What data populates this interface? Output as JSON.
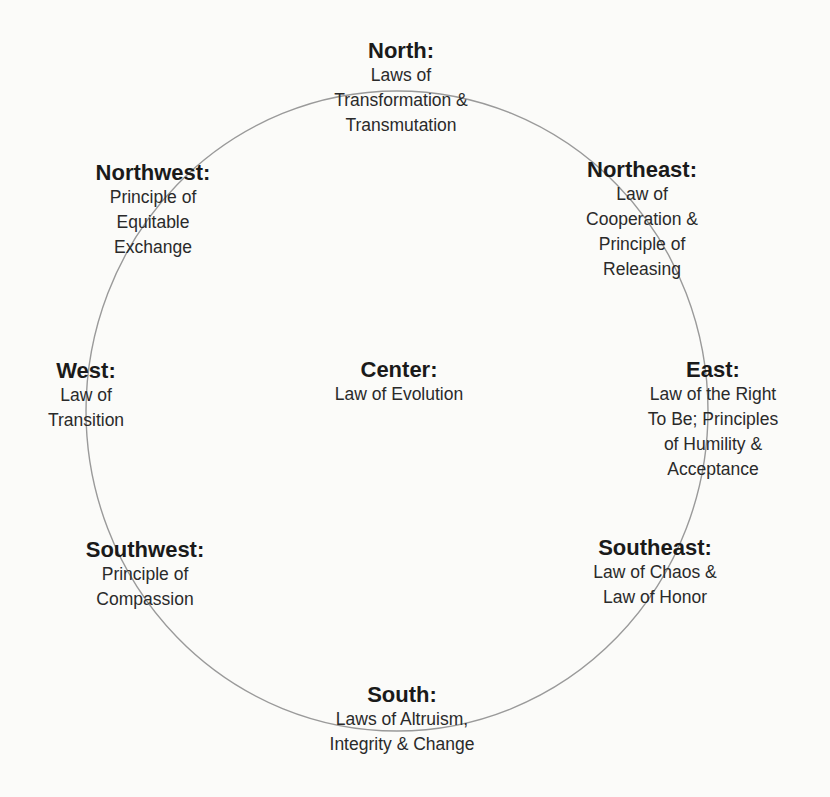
{
  "diagram": {
    "circle": {
      "cx": 397,
      "cy": 411,
      "rx": 311,
      "ry": 320,
      "stroke": "#9a9a9a"
    },
    "nodes": {
      "north": {
        "title": "North:",
        "lines": [
          "Laws of",
          "Transformation &",
          "Transmutation"
        ]
      },
      "northwest": {
        "title": "Northwest:",
        "lines": [
          "Principle of",
          "Equitable",
          "Exchange"
        ]
      },
      "northeast": {
        "title": "Northeast:",
        "lines": [
          "Law of",
          "Cooperation &",
          "Principle of",
          "Releasing"
        ]
      },
      "west": {
        "title": "West:",
        "lines": [
          "Law of",
          "Transition"
        ]
      },
      "center": {
        "title": "Center:",
        "lines": [
          "Law of Evolution"
        ]
      },
      "east": {
        "title": "East:",
        "lines": [
          "Law of the Right",
          "To Be; Principles",
          "of Humility &",
          "Acceptance"
        ]
      },
      "southwest": {
        "title": "Southwest:",
        "lines": [
          "Principle of",
          "Compassion"
        ]
      },
      "southeast": {
        "title": "Southeast:",
        "lines": [
          "Law of Chaos &",
          "Law of Honor"
        ]
      },
      "south": {
        "title": "South:",
        "lines": [
          "Laws of Altruism,",
          "Integrity & Change"
        ]
      }
    }
  }
}
